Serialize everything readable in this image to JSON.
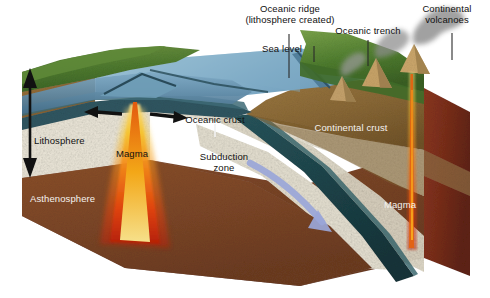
{
  "figure": {
    "type": "geology-block-diagram"
  },
  "labels": {
    "sea_level": "Sea level",
    "oceanic_ridge_line1": "Oceanic ridge",
    "oceanic_ridge_line2": "(lithosphere created)",
    "oceanic_trench": "Oceanic trench",
    "continental_volcanoes_line1": "Continental",
    "continental_volcanoes_line2": "volcanoes",
    "oceanic_crust": "Oceanic crust",
    "continental_crust": "Continental crust",
    "lithosphere": "Lithosphere",
    "asthenosphere": "Asthenosphere",
    "magma_left": "Magma",
    "magma_right": "Magma",
    "subduction_line1": "Subduction",
    "subduction_line2": "zone"
  },
  "colors": {
    "background": "#ffffff",
    "land_green_light": "#8fae55",
    "land_green_dark": "#3f6b2a",
    "water_surface": "#9dc3d8",
    "water_deep": "#5f93b0",
    "oceanic_crust_dark": "#2b4a52",
    "continental_crust": "#8a6a3a",
    "lithosphere_speckle": "#e8e4d8",
    "asthenosphere_brown": "#7b4526",
    "side_face_red_brown": "#7a2f1c",
    "slab_teal": "#1e4a50",
    "magma_orange": "#f07a18",
    "magma_yellow": "#f6c52a",
    "magma_red": "#d83a10",
    "arrow_black": "#111111",
    "arrow_blue": "#9aa6d8",
    "smoke_gray": "#6f6f6f",
    "leader_dark": "#2a2a2a",
    "leader_white": "#f2f2f2"
  },
  "annotations": {
    "spreading_arrow_left": "black-arrow-pointing-left",
    "spreading_arrow_right": "black-arrow-pointing-right",
    "lithosphere_thickness_arrow": "black-double-headed-vertical-arrow",
    "subduction_arrow": "pale-blue-arrow-down-right",
    "volcano_count": 3
  }
}
